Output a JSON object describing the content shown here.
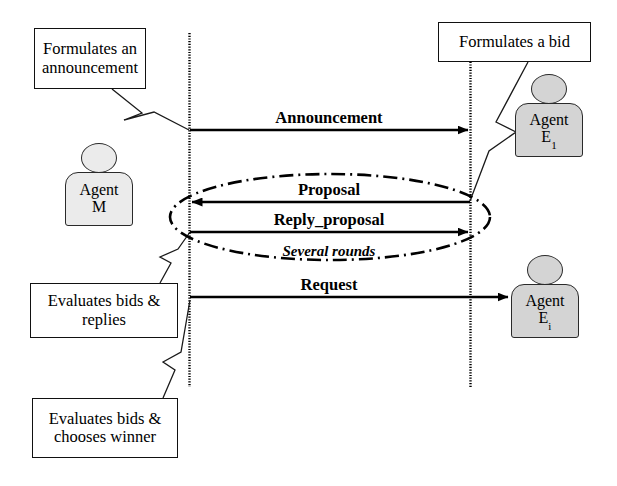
{
  "diagram": {
    "background_color": "#ffffff",
    "line_color": "#000000",
    "actor_fill": "#d4d4d4",
    "actor_fill_light": "#ebebeb"
  },
  "notes": [
    {
      "id": "note-formulates-announcement",
      "text": "Formulates an announcement"
    },
    {
      "id": "note-formulates-bid",
      "text": "Formulates a bid"
    },
    {
      "id": "note-evaluates-replies",
      "text": "Evaluates bids & replies"
    },
    {
      "id": "note-evaluates-winner",
      "text": "Evaluates bids & chooses winner"
    }
  ],
  "actors": [
    {
      "id": "actor-agent-m",
      "line1": "Agent",
      "line2": "M",
      "subscript": ""
    },
    {
      "id": "actor-agent-e1",
      "line1": "Agent",
      "line2": "E",
      "subscript": "1"
    },
    {
      "id": "actor-agent-ei",
      "line1": "Agent",
      "line2": "E",
      "subscript": "i"
    }
  ],
  "messages": [
    {
      "id": "msg-announcement",
      "label": "Announcement",
      "direction": "right",
      "style": "solid"
    },
    {
      "id": "msg-proposal",
      "label": "Proposal",
      "direction": "left",
      "style": "solid"
    },
    {
      "id": "msg-reply-proposal",
      "label": "Reply_proposal",
      "direction": "right",
      "style": "solid"
    },
    {
      "id": "msg-request",
      "label": "Request",
      "direction": "right",
      "style": "solid"
    }
  ],
  "annotations": [
    {
      "id": "annotation-several-rounds",
      "label": "Several rounds",
      "style": "bold-italic"
    }
  ],
  "lifelines": [
    {
      "id": "lifeline-manager",
      "owner": "Agent M"
    },
    {
      "id": "lifeline-bidder",
      "owner": "Agent E1"
    }
  ]
}
